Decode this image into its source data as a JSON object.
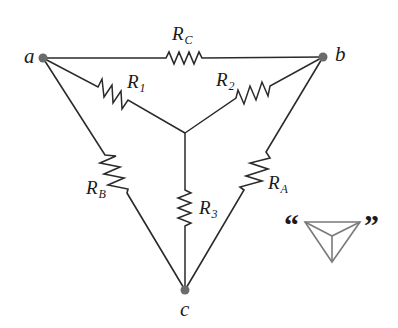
{
  "diagram": {
    "type": "circuit",
    "colors": {
      "wire": "#2a2a2a",
      "resistor": "#111111",
      "node_dot": "#6b6b6b",
      "icon_stroke": "#7a7a7a"
    },
    "nodes": [
      {
        "id": "a",
        "label": "a"
      },
      {
        "id": "b",
        "label": "b"
      },
      {
        "id": "c",
        "label": "c"
      },
      {
        "id": "center",
        "label": ""
      }
    ],
    "resistors": [
      {
        "id": "RC",
        "main": "R",
        "sub": "C",
        "between": [
          "a",
          "b"
        ],
        "network": "delta"
      },
      {
        "id": "RB",
        "main": "R",
        "sub": "B",
        "between": [
          "a",
          "c"
        ],
        "network": "delta"
      },
      {
        "id": "RA",
        "main": "R",
        "sub": "A",
        "between": [
          "b",
          "c"
        ],
        "network": "delta"
      },
      {
        "id": "R1",
        "main": "R",
        "sub": "1",
        "between": [
          "a",
          "center"
        ],
        "network": "wye"
      },
      {
        "id": "R2",
        "main": "R",
        "sub": "2",
        "between": [
          "b",
          "center"
        ],
        "network": "wye"
      },
      {
        "id": "R3",
        "main": "R",
        "sub": "3",
        "between": [
          "c",
          "center"
        ],
        "network": "wye"
      }
    ],
    "legend_icon": {
      "open_quote": "“",
      "close_quote": "”",
      "symbol": "delta-wye-icon"
    }
  }
}
